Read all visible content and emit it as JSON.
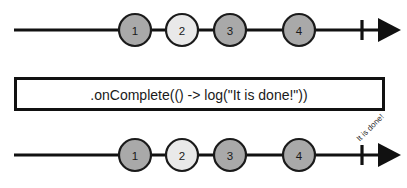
{
  "diagram": {
    "type": "marble-diagram",
    "background_color": "#ffffff",
    "line_color": "#111111",
    "marble_stroke_color": "#1a1a1a",
    "marble_fill_default": "#a9a9a9",
    "marble_fill_highlight": "#e9e9e9",
    "source_timeline": {
      "name": "source-timeline",
      "line": {
        "x1": 14,
        "x2": 400,
        "y": 30
      },
      "tick": {
        "x": 362,
        "y1": 20,
        "y2": 40
      },
      "arrow_tip_x": 401,
      "marbles": [
        {
          "label": "1",
          "cx": 135,
          "cy": 30,
          "r": 16,
          "fill": "#a9a9a9"
        },
        {
          "label": "2",
          "cx": 182,
          "cy": 30,
          "r": 16,
          "fill": "#e9e9e9"
        },
        {
          "label": "3",
          "cx": 230,
          "cy": 30,
          "r": 16,
          "fill": "#a9a9a9"
        },
        {
          "label": "4",
          "cx": 299,
          "cy": 30,
          "r": 16,
          "fill": "#a9a9a9"
        }
      ]
    },
    "operator_box": {
      "name": "operator-box",
      "x": 14,
      "y": 77,
      "width": 371,
      "height": 34,
      "text": ".onComplete(() -> log(\"It is done!\"))"
    },
    "result_timeline": {
      "name": "result-timeline",
      "line": {
        "x1": 14,
        "x2": 400,
        "y": 155
      },
      "tick": {
        "x": 362,
        "y1": 145,
        "y2": 165
      },
      "arrow_tip_x": 401,
      "marbles": [
        {
          "label": "1",
          "cx": 135,
          "cy": 155,
          "r": 16,
          "fill": "#a9a9a9"
        },
        {
          "label": "2",
          "cx": 182,
          "cy": 155,
          "r": 16,
          "fill": "#e9e9e9"
        },
        {
          "label": "3",
          "cx": 230,
          "cy": 155,
          "r": 16,
          "fill": "#a9a9a9"
        },
        {
          "label": "4",
          "cx": 299,
          "cy": 155,
          "r": 16,
          "fill": "#a9a9a9"
        }
      ],
      "completion_note": {
        "text": "It is done!",
        "x": 358,
        "y": 140,
        "rotation_deg": -45
      }
    }
  }
}
